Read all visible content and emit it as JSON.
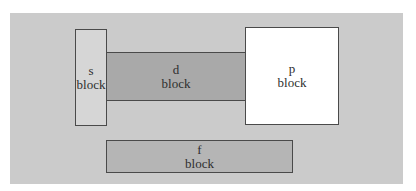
{
  "diagram": {
    "colors": {
      "background": "#cbcbcb",
      "s_block": "#d6d6d6",
      "d_block": "#a9a9a9",
      "p_block": "#ffffff",
      "f_block": "#b5b5b5",
      "border": "#4a4a4a"
    },
    "blocks": [
      {
        "id": "s",
        "letter": "s",
        "word": "block"
      },
      {
        "id": "d",
        "letter": "d",
        "word": "block"
      },
      {
        "id": "p",
        "letter": "p",
        "word": "block"
      },
      {
        "id": "f",
        "letter": "f",
        "word": "block"
      }
    ]
  }
}
